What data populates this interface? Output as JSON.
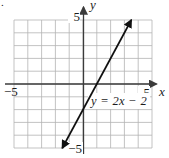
{
  "page": {
    "list_marker": "."
  },
  "graph": {
    "y_axis_label": "y",
    "x_axis_label": "x",
    "ticks": {
      "y_max": "5",
      "y_min": "−5",
      "x_min": "−5",
      "x_max": "5"
    },
    "equation_label": "y = 2x − 2"
  },
  "chart_data": {
    "type": "line",
    "title": "",
    "xlabel": "x",
    "ylabel": "y",
    "xlim": [
      -5,
      5
    ],
    "ylim": [
      -5,
      5
    ],
    "grid": true,
    "grid_step": 1,
    "axis_arrows": "positive-ends",
    "series": [
      {
        "name": "y = 2x − 2",
        "slope": 2,
        "y_intercept": -2,
        "x_intercept": 1,
        "endpoints": [
          [
            -1.5,
            -5
          ],
          [
            3.5,
            5
          ]
        ],
        "arrows": "both",
        "color": "#101010"
      }
    ],
    "annotations": [
      {
        "text": "y = 2x − 2",
        "x": 2.6,
        "y": -1.3
      }
    ],
    "colors": {
      "grid": "#b4b4b4",
      "axis": "#3b3b3b",
      "line": "#101010",
      "text": "#1c1c1c"
    }
  }
}
